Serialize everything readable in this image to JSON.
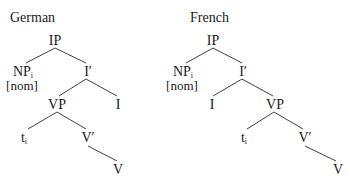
{
  "trees": [
    {
      "title": "German",
      "title_pos": [
        10,
        10
      ],
      "nodes": {
        "IP": {
          "label": "IP",
          "sub": "",
          "x": 55,
          "y": 33
        },
        "NP": {
          "label": "NP",
          "sub": "i",
          "x": 23,
          "y": 64,
          "feature": "[nom]"
        },
        "Ibar": {
          "label": "I′",
          "sub": "",
          "x": 88,
          "y": 64
        },
        "VP": {
          "label": "VP",
          "sub": "",
          "x": 57,
          "y": 97
        },
        "I": {
          "label": "I",
          "sub": "",
          "x": 118,
          "y": 97
        },
        "t": {
          "label": "t",
          "sub": "i",
          "x": 24,
          "y": 130
        },
        "Vbar": {
          "label": "V′",
          "sub": "",
          "x": 88,
          "y": 130
        },
        "V": {
          "label": "V",
          "sub": "",
          "x": 118,
          "y": 162
        }
      },
      "edges": [
        [
          55,
          48,
          26,
          63
        ],
        [
          55,
          48,
          86,
          63
        ],
        [
          86,
          79,
          59,
          96
        ],
        [
          86,
          79,
          117,
          96
        ],
        [
          57,
          112,
          28,
          129
        ],
        [
          57,
          112,
          86,
          129
        ],
        [
          88,
          146,
          117,
          161
        ]
      ]
    },
    {
      "title": "French",
      "title_pos": [
        190,
        10
      ],
      "nodes": {
        "IP": {
          "label": "IP",
          "sub": "",
          "x": 213,
          "y": 33
        },
        "NP": {
          "label": "NP",
          "sub": "i",
          "x": 183,
          "y": 64,
          "feature": "[nom]"
        },
        "Ibar": {
          "label": "I′",
          "sub": "",
          "x": 243,
          "y": 64
        },
        "I": {
          "label": "I",
          "sub": "",
          "x": 212,
          "y": 97
        },
        "VP": {
          "label": "VP",
          "sub": "",
          "x": 275,
          "y": 97
        },
        "t": {
          "label": "t",
          "sub": "i",
          "x": 244,
          "y": 130
        },
        "Vbar": {
          "label": "V′",
          "sub": "",
          "x": 305,
          "y": 130
        },
        "V": {
          "label": "V",
          "sub": "",
          "x": 338,
          "y": 162
        }
      },
      "edges": [
        [
          213,
          48,
          186,
          63
        ],
        [
          213,
          48,
          242,
          63
        ],
        [
          242,
          79,
          213,
          96
        ],
        [
          242,
          79,
          273,
          96
        ],
        [
          274,
          112,
          247,
          129
        ],
        [
          274,
          112,
          303,
          129
        ],
        [
          305,
          146,
          336,
          161
        ]
      ]
    }
  ],
  "style": {
    "line_color": "#2a2a2a",
    "text_color": "#1a1a1a",
    "background": "#ffffff"
  }
}
